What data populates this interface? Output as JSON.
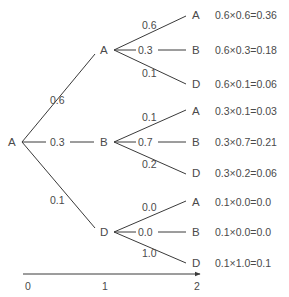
{
  "title_clipped": "",
  "colors": {
    "line": "#3a3a3a",
    "text": "#4a4a4a",
    "background": "#ffffff"
  },
  "root": {
    "label": "A"
  },
  "level1": [
    {
      "label": "A",
      "edge_prob": "0.6",
      "children": [
        {
          "label": "A",
          "edge_prob": "0.6",
          "result": "0.6×0.6=0.36"
        },
        {
          "label": "B",
          "edge_prob": "0.3",
          "result": "0.6×0.3=0.18"
        },
        {
          "label": "D",
          "edge_prob": "0.1",
          "result": "0.6×0.1=0.06"
        }
      ]
    },
    {
      "label": "B",
      "edge_prob": "0.3",
      "children": [
        {
          "label": "A",
          "edge_prob": "0.1",
          "result": "0.3×0.1=0.03"
        },
        {
          "label": "B",
          "edge_prob": "0.7",
          "result": "0.3×0.7=0.21"
        },
        {
          "label": "D",
          "edge_prob": "0.2",
          "result": "0.3×0.2=0.06"
        }
      ]
    },
    {
      "label": "D",
      "edge_prob": "0.1",
      "children": [
        {
          "label": "A",
          "edge_prob": "0.0",
          "result": "0.1×0.0=0.0"
        },
        {
          "label": "B",
          "edge_prob": "0.0",
          "result": "0.1×0.0=0.0"
        },
        {
          "label": "D",
          "edge_prob": "1.0",
          "result": "0.1×1.0=0.1"
        }
      ]
    }
  ],
  "axis": {
    "ticks": [
      "0",
      "1",
      "2"
    ]
  }
}
